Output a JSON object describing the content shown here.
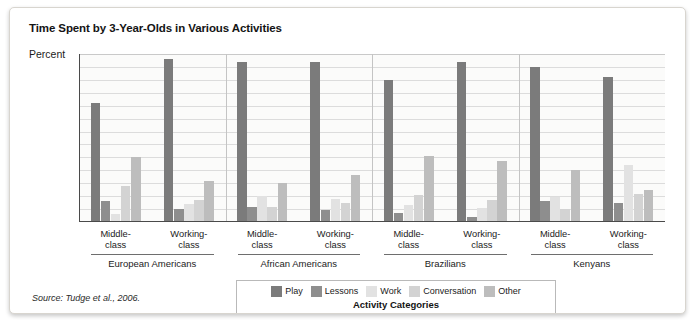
{
  "figure": {
    "title": "Time Spent by 3-Year-Olds in Various Activities",
    "source": "Source: Tudge et al., 2006.",
    "legend_title": "Activity Categories"
  },
  "chart_data": {
    "type": "bar",
    "title": "Time Spent by 3-Year-Olds in Various Activities",
    "xlabel": "Activity Categories",
    "ylabel": "Percent",
    "ylim": [
      0,
      65
    ],
    "yticks": [
      65,
      60,
      55,
      50,
      45,
      40,
      35,
      30,
      25,
      20,
      15,
      10,
      5
    ],
    "grid": true,
    "legend_position": "bottom",
    "categories": [
      "European Americans Middle-class",
      "European Americans Working-class",
      "African Americans Middle-class",
      "African Americans Working-class",
      "Brazilians Middle-class",
      "Brazilians Working-class",
      "Kenyans Middle-class",
      "Kenyans Working-class"
    ],
    "cultures": [
      {
        "name": "European Americans",
        "classes": [
          {
            "label_line1": "Middle-",
            "label_line2": "class"
          },
          {
            "label_line1": "Working-",
            "label_line2": "class"
          }
        ]
      },
      {
        "name": "African Americans",
        "classes": [
          {
            "label_line1": "Middle-",
            "label_line2": "class"
          },
          {
            "label_line1": "Working-",
            "label_line2": "class"
          }
        ]
      },
      {
        "name": "Brazilians",
        "classes": [
          {
            "label_line1": "Middle-",
            "label_line2": "class"
          },
          {
            "label_line1": "Working-",
            "label_line2": "class"
          }
        ]
      },
      {
        "name": "Kenyans",
        "classes": [
          {
            "label_line1": "Middle-",
            "label_line2": "class"
          },
          {
            "label_line1": "Working-",
            "label_line2": "class"
          }
        ]
      }
    ],
    "series": [
      {
        "name": "Play",
        "color": "#7b7b7b",
        "values": [
          46,
          63,
          62,
          62,
          55,
          62,
          60,
          56
        ]
      },
      {
        "name": "Lessons",
        "color": "#8e8e8e",
        "values": [
          8,
          5,
          6,
          4.5,
          3.5,
          2,
          8,
          7.5
        ]
      },
      {
        "name": "Work",
        "color": "#e2e2e2",
        "values": [
          3,
          7,
          10,
          9,
          6.5,
          5.5,
          9.5,
          22
        ]
      },
      {
        "name": "Conversation",
        "color": "#d3d3d3",
        "values": [
          14,
          8.5,
          6,
          7.5,
          10.5,
          8.5,
          5,
          11
        ]
      },
      {
        "name": "Other",
        "color": "#bdbdbd",
        "values": [
          25,
          16,
          15,
          18,
          25.5,
          23.5,
          20,
          12.5
        ]
      }
    ]
  }
}
